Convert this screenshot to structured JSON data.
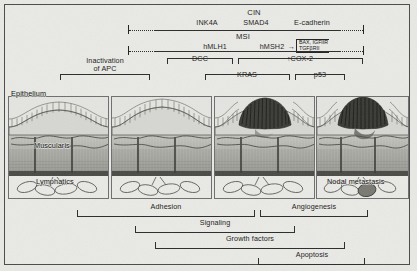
{
  "pathways": {
    "cin": {
      "heading": "CIN",
      "genes": [
        "INK4A",
        "SMAD4",
        "E-cadherin"
      ]
    },
    "msi": {
      "heading": "MSI",
      "genes": [
        "hMLH1",
        "hMSH2"
      ],
      "arrow": "→",
      "targets": [
        "BAX, IGFIIR",
        "TGFβRII"
      ]
    },
    "brackets_top": [
      {
        "label": "Inactivation of APC",
        "line1": "Inactivation",
        "line2": "of APC"
      },
      {
        "label": "DCC"
      },
      {
        "label": "↑COX-2"
      },
      {
        "label": "KRAS"
      },
      {
        "label": "p53"
      }
    ]
  },
  "tissue": {
    "labels": {
      "epithelium": "Epithelium",
      "muscularis": "Muscularis",
      "lymphatics": "Lymphatics",
      "nodal_metastasis": "Nodal metastasis"
    }
  },
  "processes": [
    {
      "label": "Adhesion"
    },
    {
      "label": "Angiogenesis"
    },
    {
      "label": "Signaling"
    },
    {
      "label": "Growth factors"
    },
    {
      "label": "Apoptosis"
    }
  ],
  "colors": {
    "background": "#e9e9e5",
    "ink": "#2b2b2b",
    "panel_fill": "#dededa",
    "dysplasia": "#3a3a3a"
  }
}
